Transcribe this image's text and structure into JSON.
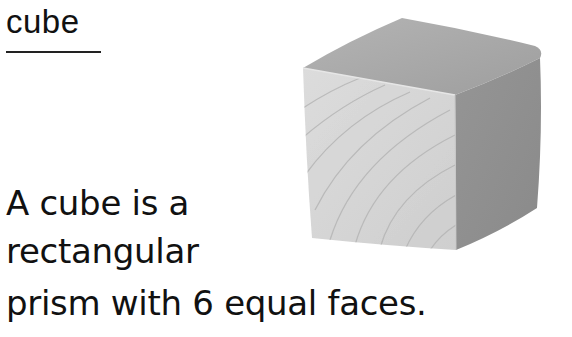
{
  "title": "cube",
  "definition": {
    "lines": [
      "A cube is a",
      "rectangular",
      "prism with 6 equal faces."
    ]
  },
  "image": {
    "subject": "wooden-cube",
    "colors": {
      "front": "#d4d4d4",
      "top": "#a9a9a9",
      "right": "#8f8f8f",
      "grain": "#b8b8b8"
    }
  }
}
